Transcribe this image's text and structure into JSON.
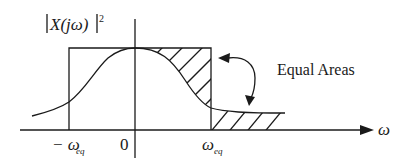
{
  "diagram": {
    "y_axis_label": {
      "base": "X(jω)",
      "exponent": "2",
      "full": "|X(jω)|²"
    },
    "x_axis_label": "ω",
    "ticks": {
      "neg_eq": {
        "prefix": "− ω",
        "subscript": "eq"
      },
      "zero": "0",
      "pos_eq": {
        "symbol": "ω",
        "subscript": "eq"
      }
    },
    "annotation": "Equal Areas",
    "colors": {
      "ink": "#1a1a1a",
      "background": "#ffffff"
    }
  }
}
